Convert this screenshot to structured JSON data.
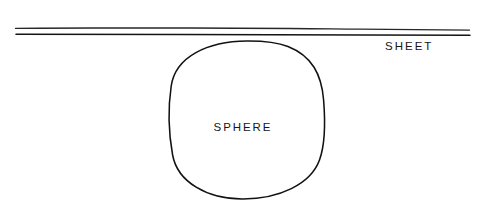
{
  "diagram": {
    "kind": "line-diagram",
    "canvas": {
      "width": 484,
      "height": 224,
      "background_color": "#ffffff"
    },
    "ink_color": "#161616",
    "labels": {
      "sheet": "SHEET",
      "sphere": "SPHERE"
    },
    "elements": {
      "sheet": {
        "name": "sheet",
        "description": "Two near-parallel horizontal lines representing a thin flat sheet seen edge-on",
        "line_count": 2,
        "x_start": 15,
        "x_end": 470,
        "upper_line_y_left": 28,
        "upper_line_y_right": 30,
        "lower_line_y_left": 34,
        "lower_line_y_right": 35,
        "stroke_color": "#1a1a1a"
      },
      "sphere": {
        "name": "sphere",
        "description": "Hand-drawn circle tangent to the underside of the sheet",
        "center_x": 247,
        "center_y": 120,
        "radius_x": 77,
        "radius_y": 79,
        "left_x": 170,
        "right_x": 324,
        "top_y": 41,
        "bottom_y": 199,
        "stroke_color": "#121212"
      }
    }
  }
}
